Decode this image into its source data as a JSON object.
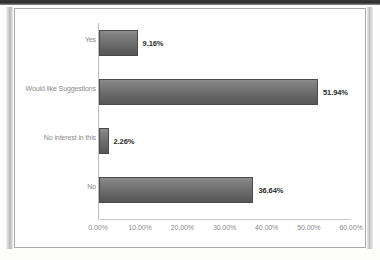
{
  "chart_data": {
    "type": "bar",
    "orientation": "horizontal",
    "title": "",
    "xlabel": "",
    "ylabel": "",
    "categories": [
      "Yes",
      "Would like Suggestions",
      "No interest in this",
      "No"
    ],
    "values": [
      9.16,
      51.94,
      2.26,
      36.64
    ],
    "value_labels": [
      "9.16%",
      "51.94%",
      "2.26%",
      "36.64%"
    ],
    "xlim": [
      0,
      60
    ],
    "xticks": [
      0,
      10,
      20,
      30,
      40,
      50,
      60
    ],
    "xtick_labels": [
      "0.00%",
      "10.00%",
      "20.00%",
      "30.00%",
      "40.00%",
      "50.00%",
      "60.00%"
    ],
    "grid": false,
    "legend": false,
    "series": [
      {
        "name": "",
        "values": [
          9.16,
          51.94,
          2.26,
          36.64
        ]
      }
    ],
    "colors": {
      "bar_fill_top": "#8d8d8d",
      "bar_fill_bottom": "#565656",
      "bar_border": "#4a4a4a",
      "axis_line": "#c9c9c9",
      "tick_text": "#8a8a8a",
      "data_label_text": "#2b2b2b",
      "plot_background": "#ffffff",
      "frame_border": "#a8a8a8"
    }
  }
}
